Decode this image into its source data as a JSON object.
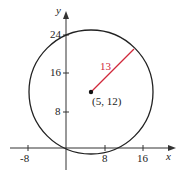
{
  "diagram": {
    "type": "circle-on-coordinate-plane",
    "axes": {
      "x_label": "x",
      "y_label": "y",
      "x_ticks": [
        "-8",
        "8",
        "16"
      ],
      "y_ticks": [
        "8",
        "16",
        "24"
      ]
    },
    "circle": {
      "center_label": "(5, 12)",
      "center": [
        5,
        12
      ],
      "radius": 13,
      "radius_label": "13"
    },
    "colors": {
      "circle": "#222222",
      "radius_line": "#d0283a",
      "axes": "#333333"
    }
  }
}
